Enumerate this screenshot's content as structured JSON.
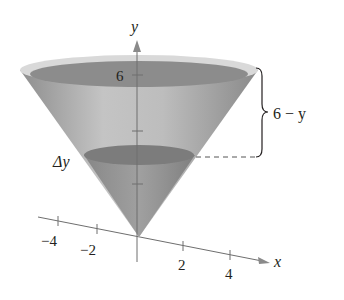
{
  "diagram": {
    "type": "cone-volume-slice",
    "axes": {
      "x_label": "x",
      "y_label": "y",
      "x_ticks": [
        "−4",
        "−2",
        "2",
        "4"
      ],
      "y_tick_label": "6"
    },
    "labels": {
      "slice": "Δy",
      "distance": "6 − y"
    },
    "colors": {
      "cone_body": "#b4b4b4",
      "cone_rim": "#d8d8d8",
      "top_surface": "#8c8c8c",
      "slice_disk": "#7a7a7a",
      "axis": "#6e6e6e",
      "text": "#231f20"
    }
  }
}
